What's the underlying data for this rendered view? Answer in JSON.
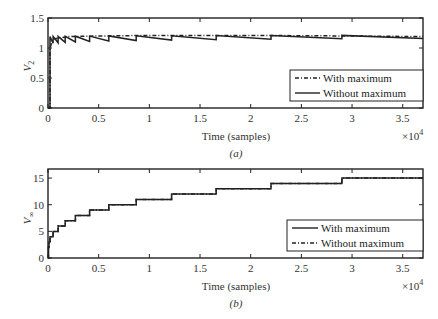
{
  "chart_data": [
    {
      "id": "a",
      "type": "line",
      "caption": "(a)",
      "xlabel": "Time (samples)",
      "x_multiplier_label": "×10",
      "x_multiplier_exp": "4",
      "ylabel_main": "V",
      "ylabel_sub": "2",
      "xlim": [
        0,
        3.7
      ],
      "ylim": [
        0,
        1.5
      ],
      "xticks": [
        "0",
        "0.5",
        "1",
        "1.5",
        "2",
        "2.5",
        "3",
        "3.5"
      ],
      "xtick_values": [
        0,
        0.5,
        1,
        1.5,
        2,
        2.5,
        3,
        3.5
      ],
      "yticks": [
        "0",
        "0.5",
        "1",
        "1.5"
      ],
      "ytick_values": [
        0,
        0.5,
        1,
        1.5
      ],
      "grid": false,
      "legend_position": "lower right",
      "series": [
        {
          "name": "With maximum",
          "style": "dashdot",
          "description": "Rises from 0 to ~1 at t≈0, then quickly to ~1.2 and stays nearly flat (~1.2)",
          "x": [
            0,
            0.02,
            0.02,
            0.05,
            0.2,
            0.5,
            1,
            2,
            3,
            3.7
          ],
          "values": [
            0,
            0,
            1.0,
            1.15,
            1.19,
            1.2,
            1.21,
            1.21,
            1.2,
            1.19
          ]
        },
        {
          "name": "Without maximum",
          "style": "solid",
          "description": "Sawtooth: jumps up at each step time then decays slightly; settles ~1.15–1.21",
          "step_times": [
            0.02,
            0.05,
            0.1,
            0.17,
            0.27,
            0.41,
            0.6,
            0.87,
            1.22,
            1.66,
            2.2,
            2.9
          ],
          "peak": 1.21,
          "trough_start": 1.08,
          "trough_end": 1.16
        }
      ]
    },
    {
      "id": "b",
      "type": "line",
      "caption": "(b)",
      "xlabel": "Time (samples)",
      "x_multiplier_label": "×10",
      "x_multiplier_exp": "4",
      "ylabel_main": "V",
      "ylabel_sub": "∞",
      "xlim": [
        0,
        3.7
      ],
      "ylim": [
        0,
        16.7
      ],
      "xticks": [
        "0",
        "0.5",
        "1",
        "1.5",
        "2",
        "2.5",
        "3",
        "3.5"
      ],
      "xtick_values": [
        0,
        0.5,
        1,
        1.5,
        2,
        2.5,
        3,
        3.5
      ],
      "yticks": [
        "0",
        "5",
        "10",
        "15"
      ],
      "ytick_values": [
        0,
        5,
        10,
        15
      ],
      "grid": false,
      "legend_position": "lower right",
      "series": [
        {
          "name": "With maximum",
          "style": "solid",
          "description": "Staircase, identical to Without maximum",
          "step_x": [
            0,
            0.005,
            0.01,
            0.02,
            0.05,
            0.1,
            0.17,
            0.27,
            0.41,
            0.6,
            0.87,
            1.22,
            1.66,
            2.2,
            2.9,
            3.7
          ],
          "step_y": [
            0,
            2,
            3,
            4,
            5,
            6,
            7,
            8,
            9,
            10,
            11,
            12,
            13,
            14,
            15,
            15
          ]
        },
        {
          "name": "Without maximum",
          "style": "dashdot",
          "description": "Staircase overlapping With maximum",
          "step_x": [
            0,
            0.005,
            0.01,
            0.02,
            0.05,
            0.1,
            0.17,
            0.27,
            0.41,
            0.6,
            0.87,
            1.22,
            1.66,
            2.2,
            2.9,
            3.7
          ],
          "step_y": [
            0,
            2,
            3,
            4,
            5,
            6,
            7,
            8,
            9,
            10,
            11,
            12,
            13,
            14,
            15,
            15
          ]
        }
      ]
    }
  ]
}
